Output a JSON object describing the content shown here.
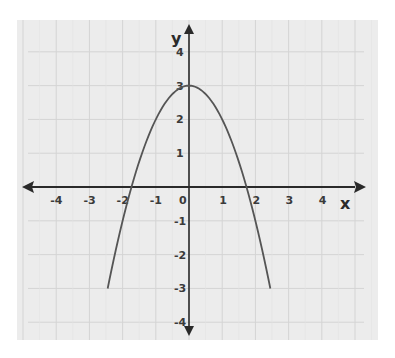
{
  "chart_data": {
    "type": "line",
    "title": "",
    "xlabel": "x",
    "ylabel": "y",
    "xlim": [
      -4,
      4
    ],
    "ylim": [
      -4,
      4
    ],
    "grid": true,
    "x_ticks": [
      "-4",
      "-3",
      "-2",
      "-1",
      "0",
      "1",
      "2",
      "3",
      "4"
    ],
    "y_ticks": [
      "4",
      "3",
      "2",
      "1",
      "-1",
      "-2",
      "-3",
      "-4"
    ],
    "series": [
      {
        "name": "y = 3 - x^2",
        "equation": "y = -x^2 + 3",
        "vertex": [
          0,
          3
        ],
        "x_intercepts": [
          -1.73,
          1.73
        ],
        "x_range": [
          -2.45,
          2.45
        ],
        "x": [
          -2.45,
          -2,
          -1.73,
          -1,
          0,
          1,
          1.73,
          2,
          2.45
        ],
        "values": [
          -3,
          -1,
          0,
          2,
          3,
          2,
          0,
          -1,
          -3
        ]
      }
    ],
    "colors": {
      "curve": "#555555",
      "axis": "#2a2a2a",
      "grid": "#d4d4d4",
      "background": "#ececec"
    }
  }
}
